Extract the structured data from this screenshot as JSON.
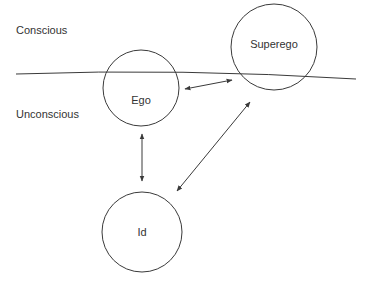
{
  "diagram": {
    "type": "psychoanalytic-structure",
    "colors": {
      "line": "#3a3a3a",
      "text": "#333333",
      "background": "#ffffff"
    },
    "regions": {
      "conscious": {
        "label": "Conscious"
      },
      "unconscious": {
        "label": "Unconscious"
      }
    },
    "nodes": [
      {
        "id": "ego",
        "label": "Ego"
      },
      {
        "id": "superego",
        "label": "Superego"
      },
      {
        "id": "id",
        "label": "Id"
      }
    ],
    "edges": [
      {
        "from": "ego",
        "to": "superego",
        "direction": "bidirectional"
      },
      {
        "from": "ego",
        "to": "id",
        "direction": "bidirectional"
      },
      {
        "from": "superego",
        "to": "id",
        "direction": "bidirectional"
      }
    ]
  }
}
